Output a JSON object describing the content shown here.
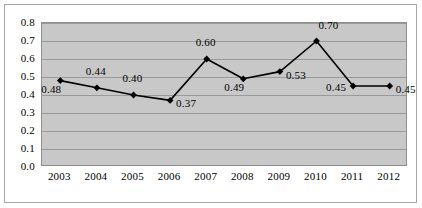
{
  "chart_data": {
    "type": "line",
    "title": "",
    "subtitle": "",
    "xlabel": "",
    "ylabel": "",
    "categories": [
      "2003",
      "2004",
      "2005",
      "2006",
      "2007",
      "2008",
      "2009",
      "2010",
      "2011",
      "2012"
    ],
    "values": [
      0.48,
      0.44,
      0.4,
      0.37,
      0.6,
      0.49,
      0.53,
      0.7,
      0.45,
      0.45
    ],
    "point_labels": [
      "0.48",
      "0.44",
      "0.40",
      "0.37",
      "0.60",
      "0.49",
      "0.53",
      "0.70",
      "0.45",
      "0.45"
    ],
    "point_label_positions": [
      "below-left",
      "above",
      "above",
      "right",
      "above",
      "below-left",
      "right",
      "above-right",
      "left",
      "right"
    ],
    "ylim": [
      0.0,
      0.8
    ],
    "ytick_step": 0.1,
    "ytick_labels": [
      "0.8",
      "0.7",
      "0.6",
      "0.5",
      "0.4",
      "0.3",
      "0.2",
      "0.1",
      "0.0"
    ],
    "ytick_values": [
      0.8,
      0.7,
      0.6,
      0.5,
      0.4,
      0.3,
      0.2,
      0.1,
      0.0
    ],
    "grid": {
      "horizontal": true,
      "vertical": false
    },
    "legend": {
      "visible": false,
      "position": "none"
    },
    "colors": {
      "plot_background": "#c8c8c8",
      "gridline": "#9a9a9a",
      "series_line": "#000000",
      "marker_fill": "#000000",
      "axis_text": "#000000",
      "figure_background": "#ffffff",
      "frame_border": "#a8a8a8"
    },
    "series_name": "Series 1",
    "marker_shape": "diamond"
  }
}
